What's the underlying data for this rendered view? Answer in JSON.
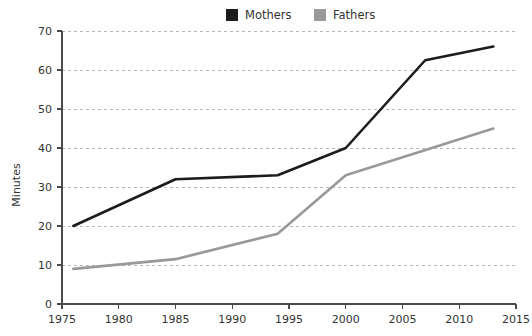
{
  "chart_data": {
    "type": "line",
    "title": "",
    "subtitle": "",
    "xlabel": "",
    "ylabel": "Minutes",
    "xlim": [
      1975,
      2015
    ],
    "ylim": [
      0,
      70
    ],
    "xticks": [
      1975,
      1980,
      1985,
      1990,
      1995,
      2000,
      2005,
      2010,
      2015
    ],
    "yticks": [
      0,
      10,
      20,
      30,
      40,
      50,
      60,
      70
    ],
    "grid": "horizontal-dashed",
    "legend_position": "top-center",
    "series": [
      {
        "name": "Mothers",
        "color": "#1c1c1c",
        "x": [
          1976,
          1985,
          1994,
          2000,
          2007,
          2013
        ],
        "values": [
          20,
          32,
          33,
          40,
          62.5,
          66
        ]
      },
      {
        "name": "Fathers",
        "color": "#999999",
        "x": [
          1976,
          1985,
          1994,
          2000,
          2013
        ],
        "values": [
          9,
          11.5,
          18,
          33,
          45
        ]
      }
    ]
  },
  "legend": {
    "items": [
      {
        "label": "Mothers",
        "color": "#1c1c1c"
      },
      {
        "label": "Fathers",
        "color": "#999999"
      }
    ]
  },
  "axes": {
    "y_title": "Minutes",
    "y_tick_labels": [
      "0",
      "10",
      "20",
      "30",
      "40",
      "50",
      "60",
      "70"
    ],
    "x_tick_labels": [
      "1975",
      "1980",
      "1985",
      "1990",
      "1995",
      "2000",
      "2005",
      "2010",
      "2015"
    ]
  }
}
